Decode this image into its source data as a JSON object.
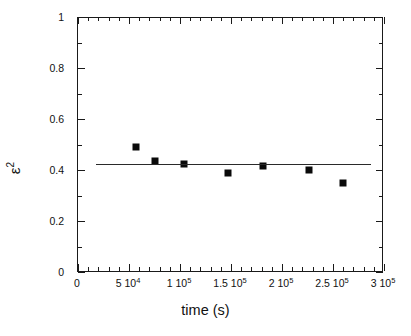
{
  "chart_data": {
    "type": "scatter",
    "title": "",
    "xlabel": "time (s)",
    "ylabel": "ε²",
    "xlim": [
      0,
      300000
    ],
    "ylim": [
      0,
      1
    ],
    "grid": false,
    "legend": null,
    "x_tick_labels": [
      "0",
      "5 10⁴",
      "1 10⁵",
      "1.5 10⁵",
      "2 10⁵",
      "2.5 10⁵",
      "3 10⁵"
    ],
    "x_tick_values": [
      0,
      50000,
      100000,
      150000,
      200000,
      250000,
      300000
    ],
    "x_minor_ticks_per_major": 5,
    "y_tick_labels": [
      "0",
      "0.2",
      "0.4",
      "0.6",
      "0.8",
      "1"
    ],
    "y_tick_values": [
      0,
      0.2,
      0.4,
      0.6,
      0.8,
      1
    ],
    "y_minor_ticks_per_major": 2,
    "series": [
      {
        "name": "epsilon squared measurements",
        "marker": "square",
        "color": "#0a0a0a",
        "x": [
          57000,
          75000,
          104000,
          147000,
          181000,
          226000,
          260000
        ],
        "y": [
          0.49,
          0.437,
          0.425,
          0.39,
          0.415,
          0.4,
          0.35
        ]
      },
      {
        "name": "mean fit line",
        "marker": "line",
        "color": "#2a2a2a",
        "x": [
          18000,
          287000
        ],
        "y": [
          0.425,
          0.425
        ]
      }
    ]
  },
  "axes": {
    "x_title": "time (s)",
    "y_title_base": "ε",
    "y_title_exp": "2"
  },
  "tick_labels": {
    "x": [
      {
        "base": "0",
        "exp": ""
      },
      {
        "base": "5 10",
        "exp": "4"
      },
      {
        "base": "1 10",
        "exp": "5"
      },
      {
        "base": "1.5 10",
        "exp": "5"
      },
      {
        "base": "2 10",
        "exp": "5"
      },
      {
        "base": "2.5 10",
        "exp": "5"
      },
      {
        "base": "3 10",
        "exp": "5"
      }
    ],
    "y": [
      "0",
      "0.2",
      "0.4",
      "0.6",
      "0.8",
      "1"
    ]
  },
  "colors": {
    "axis": "#1a1a1a",
    "marker": "#0a0a0a",
    "fit_line": "#2a2a2a",
    "background": "#ffffff"
  }
}
